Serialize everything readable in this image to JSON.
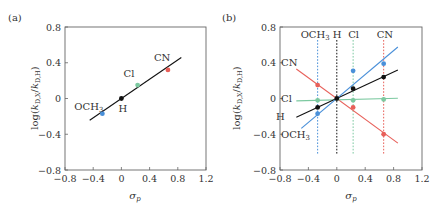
{
  "chart_data": [
    {
      "type": "scatter",
      "panel": "(a)",
      "title": "",
      "xlabel": "σp",
      "ylabel": "log(kD,X/kD,H)",
      "xlim": [
        -0.8,
        1.2
      ],
      "ylim": [
        -0.8,
        0.8
      ],
      "xticks": [
        -0.8,
        -0.4,
        0,
        0.4,
        0.8,
        1.2
      ],
      "xtick_labels": [
        "−0.8",
        "−0.4",
        "0",
        "0.4",
        "0.8",
        "1.2"
      ],
      "yticks": [
        -0.8,
        -0.4,
        0,
        0.4,
        0.8
      ],
      "ytick_labels": [
        "−0.8",
        "−0.4",
        "0",
        "0.4",
        "0.8"
      ],
      "grid": false,
      "points": [
        {
          "label": "OCH3",
          "x": -0.27,
          "y": -0.17,
          "color": "#4a90d9"
        },
        {
          "label": "H",
          "x": 0.0,
          "y": 0.0,
          "color": "#111111"
        },
        {
          "label": "Cl",
          "x": 0.23,
          "y": 0.15,
          "color": "#7cc9a0"
        },
        {
          "label": "CN",
          "x": 0.66,
          "y": 0.32,
          "color": "#e8605a"
        }
      ],
      "fit_line": {
        "x_range": [
          -0.45,
          0.85
        ],
        "slope": 0.54,
        "intercept": 0.0,
        "color": "#111111"
      }
    },
    {
      "type": "scatter",
      "panel": "(b)",
      "title": "",
      "xlabel": "σp",
      "ylabel": "log(kD,X/kD,H)",
      "xlim": [
        -0.8,
        1.2
      ],
      "ylim": [
        -0.8,
        0.8
      ],
      "xticks": [
        -0.8,
        -0.4,
        0,
        0.4,
        0.8,
        1.2
      ],
      "xtick_labels": [
        "−0.8",
        "−0.4",
        "0",
        "0.4",
        "0.8",
        "1.2"
      ],
      "yticks": [
        -0.8,
        -0.4,
        0,
        0.4,
        0.8
      ],
      "ytick_labels": [
        "−0.8",
        "−0.4",
        "0",
        "0.4",
        "0.8"
      ],
      "grid": false,
      "vertical_lines": [
        {
          "label": "OCH3",
          "x": -0.27,
          "color": "#4a90d9"
        },
        {
          "label": "H",
          "x": 0.0,
          "color": "#111111"
        },
        {
          "label": "Cl",
          "x": 0.23,
          "color": "#7cc9a0"
        },
        {
          "label": "CN",
          "x": 0.66,
          "color": "#e8605a"
        }
      ],
      "series": [
        {
          "name": "CN",
          "color": "#e8605a",
          "line": {
            "x_range": [
              -0.57,
              0.86
            ],
            "slope": -0.58,
            "intercept": 0.0
          },
          "points": [
            {
              "x": -0.27,
              "y": 0.15
            },
            {
              "x": 0.23,
              "y": -0.1
            },
            {
              "x": 0.66,
              "y": -0.4
            }
          ]
        },
        {
          "name": "Cl",
          "color": "#7cc9a0",
          "line": {
            "x_range": [
              -0.57,
              0.86
            ],
            "slope": 0.02,
            "intercept": -0.015
          },
          "points": [
            {
              "x": -0.27,
              "y": -0.02
            },
            {
              "x": 0.23,
              "y": -0.02
            },
            {
              "x": 0.66,
              "y": -0.01
            }
          ]
        },
        {
          "name": "H",
          "color": "#111111",
          "line": {
            "x_range": [
              -0.57,
              0.86
            ],
            "slope": 0.37,
            "intercept": 0.0
          },
          "points": [
            {
              "x": -0.27,
              "y": -0.1
            },
            {
              "x": 0.0,
              "y": 0.0
            },
            {
              "x": 0.23,
              "y": 0.11
            },
            {
              "x": 0.66,
              "y": 0.24
            }
          ]
        },
        {
          "name": "OCH3",
          "color": "#4a90d9",
          "line": {
            "x_range": [
              -0.5,
              0.86
            ],
            "slope": 0.67,
            "intercept": 0.0
          },
          "points": [
            {
              "x": -0.27,
              "y": -0.17
            },
            {
              "x": 0.23,
              "y": 0.31
            },
            {
              "x": 0.66,
              "y": 0.39
            }
          ]
        }
      ],
      "left_labels": [
        {
          "label": "CN",
          "y": 0.4
        },
        {
          "label": "Cl",
          "y": 0.0
        },
        {
          "label": "H",
          "y": -0.2
        },
        {
          "label": "OCH3",
          "y": -0.4
        }
      ]
    }
  ]
}
